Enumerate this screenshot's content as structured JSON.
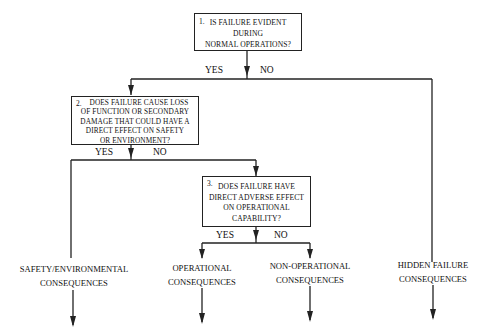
{
  "diagram": {
    "type": "decision-flowchart",
    "questions": [
      {
        "number": "1.",
        "lines": [
          "IS FAILURE EVIDENT",
          "DURING",
          "NORMAL OPERATIONS?"
        ],
        "yes_label": "YES",
        "no_label": "NO"
      },
      {
        "number": "2.",
        "lines": [
          "DOES FAILURE CAUSE LOSS",
          "OF FUNCTION OR SECONDARY",
          "DAMAGE THAT COULD HAVE A",
          "DIRECT EFFECT ON SAFETY",
          "OR  ENVIRONMENT?"
        ],
        "yes_label": "YES",
        "no_label": "NO"
      },
      {
        "number": "3.",
        "lines": [
          "DOES FAILURE HAVE",
          "DIRECT ADVERSE EFFECT",
          "ON OPERATIONAL",
          "CAPABILITY?"
        ],
        "yes_label": "YES",
        "no_label": "NO"
      }
    ],
    "outcomes": [
      {
        "line1": "SAFETY/ENVIRONMENTAL",
        "line2": "CONSEQUENCES"
      },
      {
        "line1": "OPERATIONAL",
        "line2": "CONSEQUENCES"
      },
      {
        "line1": "NON-OPERATIONAL",
        "line2": "CONSEQUENCES"
      },
      {
        "line1": "HIDDEN FAILURE",
        "line2": "CONSEQUENCES"
      }
    ],
    "colors": {
      "line": "#222222",
      "background": "#ffffff",
      "text": "#111111"
    }
  }
}
